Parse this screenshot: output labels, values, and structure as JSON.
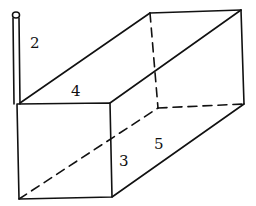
{
  "diagram": {
    "type": "rectangular-prism-with-pipe",
    "labels": {
      "pipe_height": "2",
      "front_width": "4",
      "height": "3",
      "depth": "5"
    },
    "colors": {
      "stroke": "#111111",
      "background": "#ffffff"
    }
  }
}
